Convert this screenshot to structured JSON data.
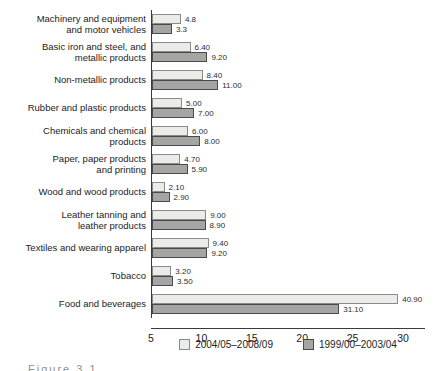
{
  "chart_data": {
    "type": "bar",
    "orientation": "horizontal",
    "title": "",
    "xlabel": "",
    "ylabel": "",
    "grid": false,
    "legend_position": "bottom",
    "categories": [
      "Machinery and equipment and motor vehicles",
      "Basic iron and steel, and metallic products",
      "Non-metallic products",
      "Rubber and plastic products",
      "Chemicals and chemical products",
      "Paper, paper products and printing",
      "Wood and wood products",
      "Leather tanning and leather products",
      "Textiles and wearing apparel",
      "Tobacco",
      "Food and beverages"
    ],
    "category_label_lines": [
      [
        "Machinery and equipment",
        "and motor vehicles"
      ],
      [
        "Basic iron and steel, and",
        "metallic products"
      ],
      [
        "Non-metallic products"
      ],
      [
        "Rubber and plastic products"
      ],
      [
        "Chemicals and chemical",
        "products"
      ],
      [
        "Paper, paper products",
        "and printing"
      ],
      [
        "Wood and wood products"
      ],
      [
        "Leather tanning and",
        "leather products"
      ],
      [
        "Textiles and wearing apparel"
      ],
      [
        "Tobacco"
      ],
      [
        "Food and beverages"
      ]
    ],
    "series": [
      {
        "name": "2004/05–2008/09",
        "fill": "#eaece7",
        "values": [
          4.8,
          6.4,
          8.4,
          5.0,
          6.0,
          4.7,
          2.1,
          9.0,
          9.4,
          3.2,
          40.9
        ],
        "value_labels": [
          "4.8",
          "6.40",
          "8.40",
          "5.00",
          "6.00",
          "4.70",
          "2.10",
          "9.00",
          "9.40",
          "3.20",
          "40.90"
        ]
      },
      {
        "name": "1999/00–2003/04",
        "fill": "#a5a5a3",
        "values": [
          3.3,
          9.2,
          11.0,
          7.0,
          8.0,
          5.9,
          2.9,
          8.9,
          9.2,
          3.5,
          31.1
        ],
        "value_labels": [
          "3.3",
          "9.20",
          "11.00",
          "7.00",
          "8.00",
          "5.90",
          "2.90",
          "8.90",
          "9.20",
          "3.50",
          "31.10"
        ]
      }
    ],
    "x_tick_labels": [
      "5",
      "10",
      "15",
      "20",
      "25",
      "30"
    ]
  },
  "footer": {
    "cutoff_caption": "Figure 3.1"
  }
}
